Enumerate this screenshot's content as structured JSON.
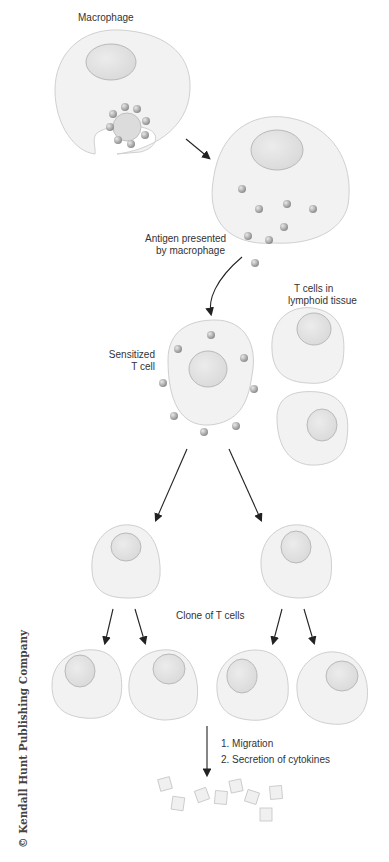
{
  "labels": {
    "macrophage": "Macrophage",
    "antigen_presented_line1": "Antigen presented",
    "antigen_presented_line2": "by macrophage",
    "t_cells_line1": "T cells in",
    "t_cells_line2": "lymphoid tissue",
    "sensitized_line1": "Sensitized",
    "sensitized_line2": "T cell",
    "clone": "Clone of T cells",
    "step1": "1. Migration",
    "step2": "2. Secretion of cytokines"
  },
  "copyright": "© Kendall Hunt Publishing Company",
  "colors": {
    "cell_fill": "#f2f2f2",
    "cell_stroke": "#cfcfcf",
    "nucleus_fill": "#e4e4e4",
    "nucleus_stroke": "#b9b9b9",
    "antigen": "#a8a8a8",
    "arrow": "#222222"
  }
}
